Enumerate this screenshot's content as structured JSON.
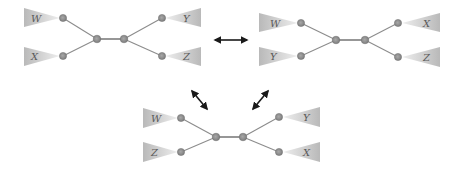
{
  "diagram": {
    "type": "unrooted-tree-rearrangement",
    "colors": {
      "edge": "#8c8c8c",
      "node_fill": "#8a8a8a",
      "node_stroke": "#6f6f6f",
      "triangle_dark": "#bcbcbc",
      "triangle_light": "#ececec",
      "arrow": "#1a1a1a"
    },
    "trees": [
      {
        "id": "tree-top-left",
        "left_top_label": "W",
        "left_bottom_label": "X",
        "right_top_label": "Y",
        "right_bottom_label": "Z"
      },
      {
        "id": "tree-top-right",
        "left_top_label": "W",
        "left_bottom_label": "Y",
        "right_top_label": "X",
        "right_bottom_label": "Z"
      },
      {
        "id": "tree-bottom",
        "left_top_label": "W",
        "left_bottom_label": "Z",
        "right_top_label": "Y",
        "right_bottom_label": "X"
      }
    ],
    "arrows": [
      {
        "from": "tree-top-left",
        "to": "tree-top-right",
        "bidirectional": true
      },
      {
        "from": "tree-top-left",
        "to": "tree-bottom",
        "bidirectional": true
      },
      {
        "from": "tree-top-right",
        "to": "tree-bottom",
        "bidirectional": true
      }
    ]
  }
}
